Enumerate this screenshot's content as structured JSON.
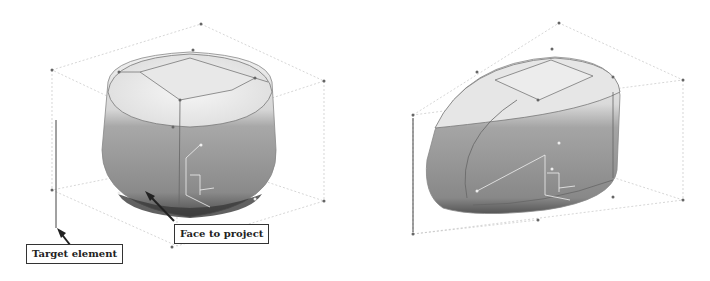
{
  "figure": {
    "panels": [
      {
        "id": "left",
        "shape": "rounded-cube",
        "callouts": {
          "target_element": "Target element",
          "face_to_project": "Face to project"
        }
      },
      {
        "id": "right",
        "shape": "projected-rounded-wedge"
      }
    ]
  },
  "colors": {
    "background": "#ffffff",
    "surface_light": "#eeeeee",
    "surface_dark": "#5a5a5a",
    "bounding_lines": "#bbbbbb",
    "control_points": "#666666",
    "callout_border": "#333333"
  }
}
